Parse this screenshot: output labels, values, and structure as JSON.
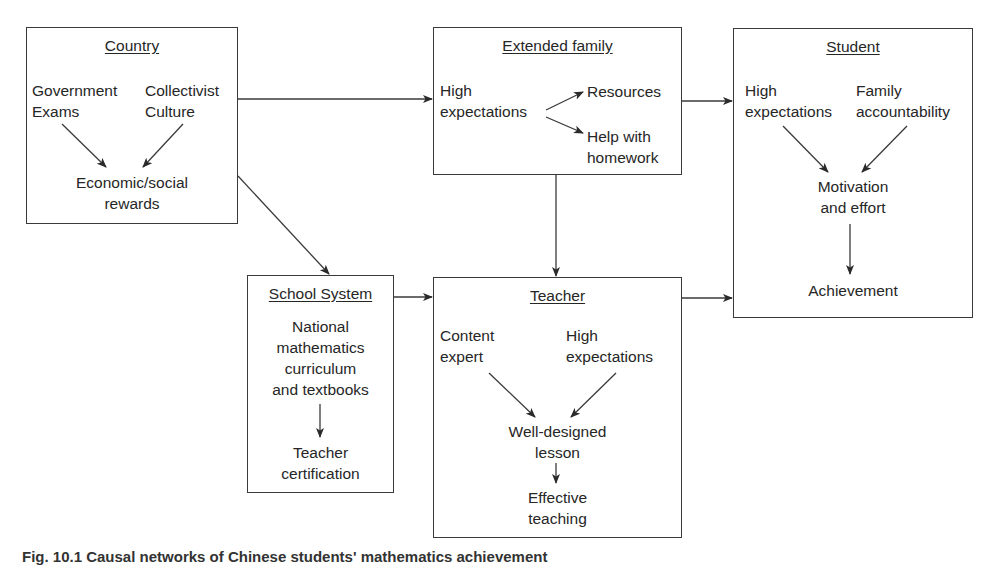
{
  "diagram": {
    "nodes": {
      "country": {
        "title": "Country",
        "items": {
          "government_exams": [
            "Government",
            "Exams"
          ],
          "collectivist_culture": [
            "Collectivist",
            "Culture"
          ],
          "economic_social_rewards": [
            "Economic/social",
            "rewards"
          ]
        }
      },
      "extended_family": {
        "title": "Extended family",
        "items": {
          "high_expectations": [
            "High",
            "expectations"
          ],
          "resources": [
            "Resources"
          ],
          "help_with_homework": [
            "Help with",
            "homework"
          ]
        }
      },
      "student": {
        "title": "Student",
        "items": {
          "high_expectations": [
            "High",
            "expectations"
          ],
          "family_accountability": [
            "Family",
            "accountability"
          ],
          "motivation_effort": [
            "Motivation",
            "and effort"
          ],
          "achievement": [
            "Achievement"
          ]
        }
      },
      "school_system": {
        "title": "School System",
        "items": {
          "curriculum": [
            "National",
            "mathematics",
            "curriculum",
            "and textbooks"
          ],
          "teacher_certification": [
            "Teacher",
            "certification"
          ]
        }
      },
      "teacher": {
        "title": "Teacher",
        "items": {
          "content_expert": [
            "Content",
            "expert"
          ],
          "high_expectations": [
            "High",
            "expectations"
          ],
          "well_designed_lesson": [
            "Well-designed",
            "lesson"
          ],
          "effective_teaching": [
            "Effective",
            "teaching"
          ]
        }
      }
    },
    "edges": [
      [
        "Country",
        "Extended family"
      ],
      [
        "Country",
        "School System"
      ],
      [
        "Extended family",
        "Student"
      ],
      [
        "Extended family",
        "Teacher"
      ],
      [
        "School System",
        "Teacher"
      ],
      [
        "Teacher",
        "Student"
      ],
      [
        "Government Exams",
        "Economic/social rewards"
      ],
      [
        "Collectivist Culture",
        "Economic/social rewards"
      ],
      [
        "High expectations (family)",
        "Resources"
      ],
      [
        "High expectations (family)",
        "Help with homework"
      ],
      [
        "High expectations (student)",
        "Motivation and effort"
      ],
      [
        "Family accountability",
        "Motivation and effort"
      ],
      [
        "Motivation and effort",
        "Achievement"
      ],
      [
        "National mathematics curriculum and textbooks",
        "Teacher certification"
      ],
      [
        "Content expert",
        "Well-designed lesson"
      ],
      [
        "High expectations (teacher)",
        "Well-designed lesson"
      ],
      [
        "Well-designed lesson",
        "Effective teaching"
      ]
    ],
    "caption": "Fig. 10.1 Causal networks of Chinese students' mathematics achievement"
  }
}
